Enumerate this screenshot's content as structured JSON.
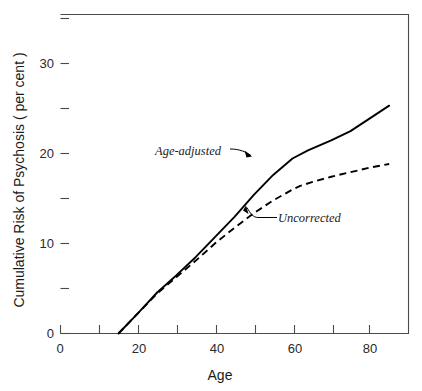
{
  "chart_data": {
    "type": "line",
    "title": "",
    "subtitle": "",
    "xlabel": "Age",
    "ylabel": "Cumulative Risk of Psychosis ( per cent )",
    "xlim": [
      0,
      90
    ],
    "ylim": [
      0,
      35
    ],
    "grid": false,
    "legend_position": "inline-annotations",
    "x_ticks_major": [
      0,
      20,
      40,
      60,
      80
    ],
    "x_ticks_major_labels": [
      "0",
      "20",
      "40",
      "60",
      "80"
    ],
    "x_ticks_minor": [
      10,
      30,
      50,
      70,
      90
    ],
    "y_ticks_major": [
      0,
      10,
      20,
      30
    ],
    "y_ticks_major_labels": [
      "0",
      "10",
      "20",
      "30"
    ],
    "y_ticks_minor": [
      5,
      15,
      25,
      35
    ],
    "series": [
      {
        "name": "Age-adjusted",
        "style": "solid",
        "x": [
          15,
          20,
          25,
          30,
          35,
          40,
          45,
          50,
          55,
          60,
          64,
          70,
          75,
          80,
          85
        ],
        "values": [
          0,
          2.2,
          4.5,
          6.4,
          8.4,
          10.6,
          12.8,
          15.2,
          17.4,
          19.2,
          20.1,
          21.2,
          22.2,
          23.6,
          25.0
        ]
      },
      {
        "name": "Uncorrected",
        "style": "dashed",
        "x": [
          15,
          20,
          25,
          30,
          35,
          40,
          45,
          50,
          55,
          60,
          62,
          65,
          70,
          75,
          80,
          85
        ],
        "values": [
          0,
          2.2,
          4.4,
          6.2,
          8.0,
          9.9,
          11.6,
          13.2,
          14.6,
          15.8,
          16.2,
          16.6,
          17.2,
          17.7,
          18.2,
          18.6
        ]
      }
    ],
    "annotations": [
      {
        "text": "Age-adjusted",
        "points_to_series": "Age-adjusted",
        "arrow": true
      },
      {
        "text": "Uncorrected",
        "points_to_series": "Uncorrected",
        "arrow": true
      }
    ],
    "colors": {
      "series_line": "#000000",
      "axis": "#4a4a4a",
      "background": "#ffffff",
      "text": "#1a1a1a"
    }
  }
}
